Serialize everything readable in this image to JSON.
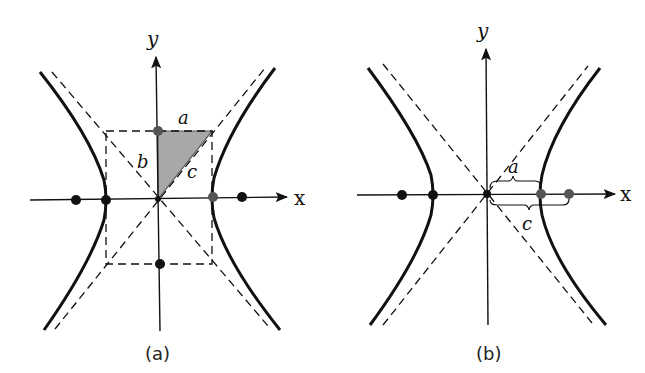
{
  "figure": {
    "colors": {
      "ink": "#111111",
      "highlight_point": "#555555",
      "triangle_fill": "#a8a8a8",
      "background": "#ffffff"
    }
  },
  "panel_a": {
    "caption": "(a)",
    "axis_x_label": "x",
    "axis_y_label": "y",
    "label_a": "a",
    "label_b": "b",
    "label_c": "c",
    "elements": [
      "hyperbola branches",
      "dashed asymptotes",
      "dashed central rectangle",
      "shaded right triangle with legs a, b and hypotenuse c",
      "foci",
      "vertices",
      "co-vertices"
    ]
  },
  "panel_b": {
    "caption": "(b)",
    "axis_x_label": "x",
    "axis_y_label": "y",
    "label_a": "a",
    "label_c": "c",
    "elements": [
      "hyperbola branches",
      "dashed asymptotes",
      "brace a: center to vertex",
      "brace c: center to focus",
      "foci",
      "vertices"
    ]
  }
}
